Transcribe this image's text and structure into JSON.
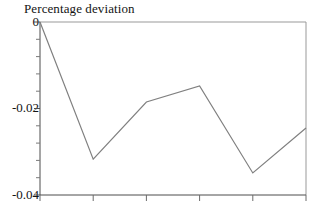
{
  "chart_data": {
    "type": "line",
    "title": "Percentage deviation",
    "xlabel": "",
    "ylabel": "",
    "ylim": [
      -0.04,
      0
    ],
    "xlim": [
      0,
      5
    ],
    "grid": false,
    "legend": null,
    "y_ticks": [
      "0",
      "-0.02",
      "-0.04"
    ],
    "y_tick_values": [
      0,
      -0.02,
      -0.04
    ],
    "y_minor_tick_count": 4,
    "x_ticks": [
      "",
      "",
      "",
      "",
      "",
      ""
    ],
    "x_tick_values": [
      0,
      1,
      2,
      3,
      4,
      5
    ],
    "line_color": "#808080",
    "series": [
      {
        "name": "Percentage deviation",
        "x": [
          0,
          1,
          2,
          3,
          4,
          5
        ],
        "values": [
          0,
          -0.0317,
          -0.0185,
          -0.0148,
          -0.0349,
          -0.0245
        ]
      }
    ]
  },
  "axis_labels": {
    "y0": "0",
    "y1": "-0.02",
    "y2": "-0.04"
  },
  "figure": {
    "title": "Percentage deviation"
  }
}
